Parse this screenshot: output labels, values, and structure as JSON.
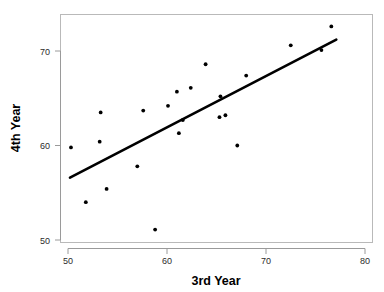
{
  "chart_data": {
    "type": "scatter",
    "title": "",
    "xlabel": "3rd Year",
    "ylabel": "4th Year",
    "xlim": [
      49.0,
      80.2
    ],
    "ylim": [
      49.0,
      73.6
    ],
    "xticks": [
      50,
      60,
      70,
      80
    ],
    "yticks": [
      50,
      60,
      70
    ],
    "xtick_labels": [
      "50",
      "60",
      "70",
      "80"
    ],
    "ytick_labels": [
      "50",
      "60",
      "70"
    ],
    "grid": false,
    "legend": null,
    "points": [
      {
        "x": 50.3,
        "y": 59.8
      },
      {
        "x": 51.8,
        "y": 54.0
      },
      {
        "x": 53.2,
        "y": 60.4
      },
      {
        "x": 53.3,
        "y": 63.5
      },
      {
        "x": 53.9,
        "y": 55.4
      },
      {
        "x": 57.0,
        "y": 57.8
      },
      {
        "x": 57.6,
        "y": 63.7
      },
      {
        "x": 58.8,
        "y": 51.1
      },
      {
        "x": 60.1,
        "y": 64.2
      },
      {
        "x": 61.0,
        "y": 65.7
      },
      {
        "x": 61.2,
        "y": 61.3
      },
      {
        "x": 61.6,
        "y": 62.7
      },
      {
        "x": 62.4,
        "y": 66.1
      },
      {
        "x": 63.9,
        "y": 68.6
      },
      {
        "x": 65.3,
        "y": 63.0
      },
      {
        "x": 65.4,
        "y": 65.2
      },
      {
        "x": 65.9,
        "y": 63.2
      },
      {
        "x": 67.1,
        "y": 60.0
      },
      {
        "x": 68.0,
        "y": 67.4
      },
      {
        "x": 72.5,
        "y": 70.6
      },
      {
        "x": 75.6,
        "y": 70.1
      },
      {
        "x": 76.6,
        "y": 72.6
      }
    ],
    "fit_line": {
      "type": "linear-regression",
      "x_start": 50.2,
      "y_start": 56.6,
      "x_end": 77.1,
      "y_end": 71.2
    }
  },
  "axes": {
    "x_axis_name": "3rd Year",
    "y_axis_name": "4th Year"
  },
  "colors": {
    "point": "#000000",
    "fit_line": "#000000",
    "frame": "#b9b9b9",
    "background": "#ffffff",
    "tick_text": "#2b2b2b"
  }
}
